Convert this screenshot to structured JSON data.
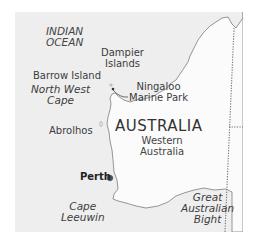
{
  "map": {
    "title": "Western Australia map",
    "colors": {
      "sea": "#eeeeee",
      "land": "#fbfbfb",
      "coastline": "#8a8a8a",
      "border_dotted": "#777777",
      "city_dot": "#555555",
      "page_background": "#ffffff"
    },
    "labels": {
      "ocean_line1": "INDIAN",
      "ocean_line2": "OCEAN",
      "dampier_line1": "Dampier",
      "dampier_line2": "Islands",
      "barrow": "Barrow Island",
      "nwcape_line1": "North West",
      "nwcape_line2": "Cape",
      "ningaloo_line1": "Ningaloo",
      "ningaloo_line2": "Marine Park",
      "abrolhos": "Abrolhos",
      "country": "AUSTRALIA",
      "state_line1": "Western",
      "state_line2": "Australia",
      "city": "Perth",
      "leeuwin_line1": "Cape",
      "leeuwin_line2": "Leeuwin",
      "bight_line1": "Great",
      "bight_line2": "Australian",
      "bight_line3": "Bight"
    }
  }
}
